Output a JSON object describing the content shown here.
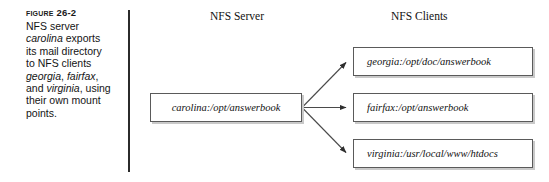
{
  "figure": {
    "label": "Figure 26-2",
    "caption_segments": [
      {
        "text": "NFS server ",
        "italic": false
      },
      {
        "text": "carolina",
        "italic": true
      },
      {
        "text": " exports its mail directory to NFS clients ",
        "italic": false
      },
      {
        "text": "georgia",
        "italic": true
      },
      {
        "text": ", ",
        "italic": false
      },
      {
        "text": "fairfax",
        "italic": true
      },
      {
        "text": ", and ",
        "italic": false
      },
      {
        "text": "virginia",
        "italic": true
      },
      {
        "text": ", using their own mount points.",
        "italic": false
      }
    ],
    "caption_plain": "NFS server carolina exports its mail directory to NFS clients georgia, fairfax, and virginia, using their own mount points."
  },
  "diagram": {
    "headings": {
      "server": "NFS Server",
      "clients": "NFS Clients"
    },
    "server_node": {
      "label": "carolina:/opt/answerbook",
      "host": "carolina",
      "path": "/opt/answerbook"
    },
    "client_nodes": [
      {
        "label": "georgia:/opt/doc/answerbook",
        "host": "georgia",
        "path": "/opt/doc/answerbook"
      },
      {
        "label": "fairfax:/opt/answerbook",
        "host": "fairfax",
        "path": "/opt/answerbook"
      },
      {
        "label": "virginia:/usr/local/www/htdocs",
        "host": "virginia",
        "path": "/usr/local/www/htdocs"
      }
    ],
    "connectors": [
      {
        "from": "server_node",
        "to": "client_nodes.0",
        "style": "solid-arrow"
      },
      {
        "from": "server_node",
        "to": "client_nodes.1",
        "style": "solid-arrow"
      },
      {
        "from": "server_node",
        "to": "client_nodes.2",
        "style": "solid-arrow"
      }
    ],
    "colors": {
      "line": "#4a4a4a",
      "box_border": "#5a5a5a",
      "box_shadow": "#c9c9c9",
      "divider": "#2b2b2b",
      "text": "#111111",
      "background": "#ffffff"
    }
  }
}
